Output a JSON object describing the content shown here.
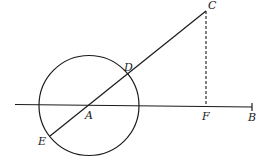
{
  "diagram": {
    "type": "geometry",
    "colors": {
      "stroke": "#1a1a1a",
      "background": "#ffffff"
    },
    "points": {
      "A": {
        "label": "A",
        "x": 89,
        "y": 105
      },
      "B": {
        "label": "B",
        "x": 252,
        "y": 107
      },
      "C": {
        "label": "C",
        "x": 206,
        "y": 11
      },
      "D": {
        "label": "D",
        "x": 128,
        "y": 74
      },
      "E": {
        "label": "E",
        "x": 50,
        "y": 136
      },
      "F": {
        "label": "F",
        "x": 206,
        "y": 106
      }
    },
    "circle": {
      "center": "A",
      "radius": 50
    },
    "segments": [
      {
        "from": "E",
        "to": "C",
        "style": "solid"
      },
      {
        "from": "start",
        "to": "B",
        "style": "solid"
      },
      {
        "from": "C",
        "to": "F",
        "style": "dashed"
      }
    ]
  }
}
